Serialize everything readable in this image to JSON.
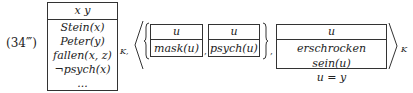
{
  "equation": {
    "label": "(34‴)",
    "main_drs": {
      "universe": "x y",
      "conditions": [
        "Stein(x)",
        "Peter(y)",
        "fallen(x, z)",
        "¬psych(x)",
        "..."
      ],
      "subscript": "K,"
    },
    "tuple": {
      "open": "⟨",
      "close": "⟩",
      "set_open": "{",
      "set_close": "}",
      "set_drs": [
        {
          "universe": "u",
          "conditions": [
            "mask(u)"
          ]
        },
        {
          "universe": "u",
          "conditions": [
            "psych(u)"
          ]
        }
      ],
      "separator": ",",
      "third_drs": {
        "universe": "u",
        "conditions": [
          "erschrocken sein(u)",
          "u = y"
        ]
      },
      "subscript": "K"
    }
  }
}
